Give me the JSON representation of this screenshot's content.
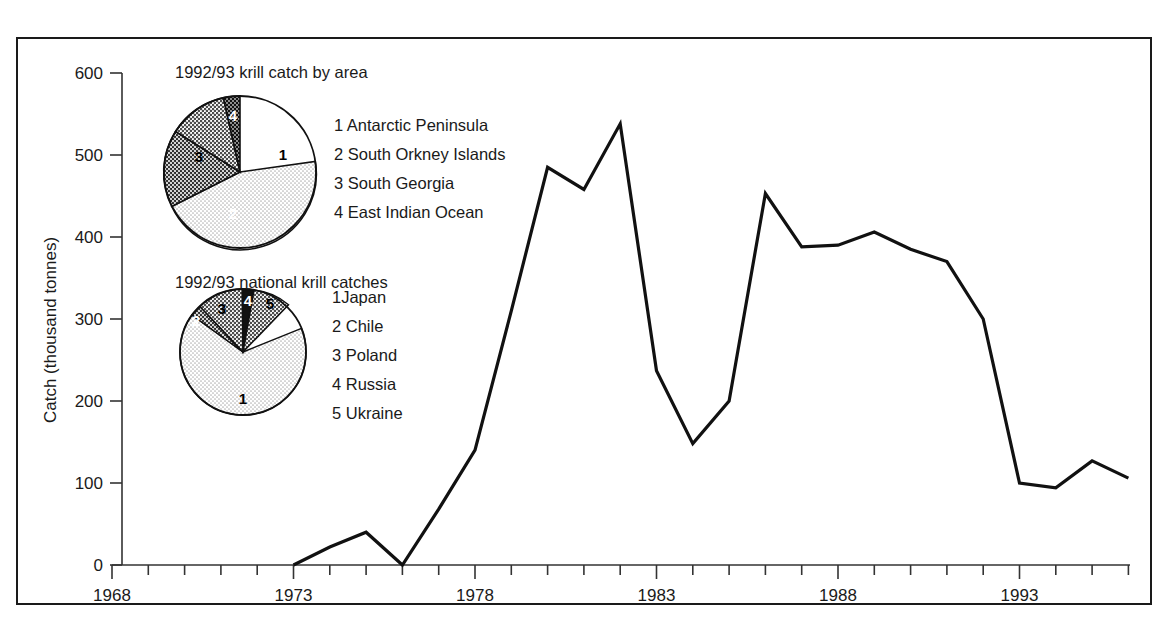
{
  "chart_data": {
    "type": "line",
    "title": "",
    "xlabel": "",
    "ylabel": "Catch (thousand tonnes)",
    "xlim": [
      1968,
      1996
    ],
    "ylim": [
      0,
      600
    ],
    "grid": false,
    "legend_position": "inset-left",
    "x_tick_labels": [
      "1968",
      "1973",
      "1978",
      "1983",
      "1988",
      "1993"
    ],
    "x_tick_values": [
      1968,
      1973,
      1978,
      1983,
      1988,
      1993
    ],
    "x_minor_tick_interval": 1,
    "y_tick_labels": [
      "0",
      "100",
      "200",
      "300",
      "400",
      "500",
      "600"
    ],
    "y_tick_values": [
      0,
      100,
      200,
      300,
      400,
      500,
      600
    ],
    "x": [
      1973,
      1974,
      1975,
      1976,
      1977,
      1978,
      1979,
      1980,
      1981,
      1982,
      1983,
      1984,
      1985,
      1986,
      1987,
      1988,
      1989,
      1990,
      1991,
      1992,
      1993,
      1994,
      1995,
      1996
    ],
    "values": [
      0,
      22,
      40,
      0,
      68,
      140,
      310,
      485,
      458,
      538,
      237,
      148,
      200,
      453,
      388,
      390,
      406,
      385,
      370,
      300,
      100,
      94,
      127,
      106
    ],
    "series": [
      {
        "name": "Krill catch",
        "x": [
          1973,
          1974,
          1975,
          1976,
          1977,
          1978,
          1979,
          1980,
          1981,
          1982,
          1983,
          1984,
          1985,
          1986,
          1987,
          1988,
          1989,
          1990,
          1991,
          1992,
          1993,
          1994,
          1995,
          1996
        ],
        "values": [
          0,
          22,
          40,
          0,
          68,
          140,
          310,
          485,
          458,
          538,
          237,
          148,
          200,
          453,
          388,
          390,
          406,
          385,
          370,
          300,
          100,
          94,
          127,
          106
        ]
      }
    ],
    "inset_charts": [
      {
        "type": "pie",
        "title": "1992/93 krill catch by area",
        "labels": [
          "1",
          "2",
          "3",
          "4"
        ],
        "legend": [
          "1 Antarctic Peninsula",
          "2 South Orkney Islands",
          "3 South Georgia",
          "4 East Indian Ocean"
        ],
        "values": [
          45,
          16,
          33,
          6
        ],
        "fills": [
          "light-dot",
          "dark-dot",
          "medium-dot",
          "darkest-dot"
        ]
      },
      {
        "type": "pie",
        "title": "1992/93 national krill catches",
        "labels": [
          "1",
          "2",
          "3",
          "4",
          "5"
        ],
        "legend": [
          "1Japan",
          "2 Chile",
          "3 Poland",
          "4 Russia",
          "5 Ukraine"
        ],
        "values": [
          66,
          3,
          20,
          3,
          8
        ],
        "fills": [
          "light-dot",
          "dark-dot",
          "medium-dot",
          "black",
          "medium-dot"
        ]
      }
    ]
  },
  "axes": {
    "y_title": "Catch (thousand tonnes)",
    "y_ticks": [
      "600",
      "500",
      "400",
      "300",
      "200",
      "100",
      "0"
    ],
    "x_ticks": [
      "1968",
      "1973",
      "1978",
      "1983",
      "1988",
      "1993"
    ]
  },
  "pie_area": {
    "title": "1992/93 krill catch by area",
    "slice_labels": [
      "1",
      "2",
      "3",
      "4"
    ],
    "legend": [
      "1 Antarctic Peninsula",
      "2 South Orkney Islands",
      "3 South Georgia",
      "4 East Indian Ocean"
    ]
  },
  "pie_national": {
    "title": "1992/93 national krill catches",
    "slice_labels": [
      "1",
      "2",
      "3",
      "4",
      "5"
    ],
    "legend": [
      "1Japan",
      "2 Chile",
      "3 Poland",
      "4 Russia",
      "5 Ukraine"
    ]
  },
  "colors": {
    "line": "#111111",
    "axis": "#333333",
    "frame": "#1a1a1a",
    "background": "#ffffff",
    "slice_light": "#e2e2e2",
    "slice_medium": "#9a9a9a",
    "slice_dark": "#5a5a5a",
    "slice_black": "#111111"
  }
}
